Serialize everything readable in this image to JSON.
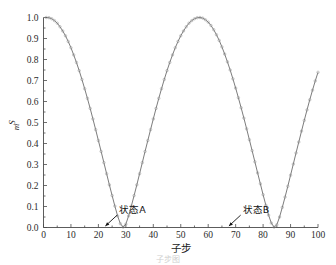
{
  "figure": {
    "caption_fragment": "子步图"
  },
  "chart_data": {
    "type": "line",
    "title": "",
    "subtitle": "",
    "xlabel": "子步",
    "ylabel": "S_m",
    "ylabel_base": "S",
    "ylabel_sub": "m",
    "xlim": [
      0,
      100
    ],
    "ylim": [
      0.0,
      1.0
    ],
    "grid": false,
    "legend": null,
    "legend_position": "none",
    "marker": "open-circle",
    "line_style": "solid",
    "line_color": "#5a5a5a",
    "marker_color": "#8a8a8a",
    "xticks": [
      0,
      10,
      20,
      30,
      40,
      50,
      60,
      70,
      80,
      90,
      100
    ],
    "xtick_labels": [
      "0",
      "10",
      "20",
      "30",
      "40",
      "50",
      "60",
      "70",
      "80",
      "90",
      "100"
    ],
    "yticks": [
      0.0,
      0.1,
      0.2,
      0.3,
      0.4,
      0.5,
      0.6,
      0.7,
      0.8,
      0.9,
      1.0
    ],
    "ytick_labels": [
      "0.0",
      "0.1",
      "0.2",
      "0.3",
      "0.4",
      "0.5",
      "0.6",
      "0.7",
      "0.8",
      "0.9",
      "1.0"
    ],
    "series": [
      {
        "name": "Sm",
        "x": [
          1,
          2,
          3,
          4,
          5,
          6,
          7,
          8,
          9,
          10,
          11,
          12,
          13,
          14,
          15,
          16,
          17,
          18,
          19,
          20,
          21,
          22,
          23,
          24,
          25,
          26,
          27,
          28,
          29,
          30,
          31,
          32,
          33,
          34,
          35,
          36,
          37,
          38,
          39,
          40,
          41,
          42,
          43,
          44,
          45,
          46,
          47,
          48,
          49,
          50,
          51,
          52,
          53,
          54,
          55,
          56,
          57,
          58,
          59,
          60,
          61,
          62,
          63,
          64,
          65,
          66,
          67,
          68,
          69,
          70,
          71,
          72,
          73,
          74,
          75,
          76,
          77,
          78,
          79,
          80,
          81,
          82,
          83,
          84,
          85,
          86,
          87,
          88,
          89,
          90,
          91,
          92,
          93,
          94,
          95,
          96,
          97,
          98,
          99,
          100
        ],
        "values": [
          1.0,
          0.999,
          0.994,
          0.985,
          0.973,
          0.956,
          0.936,
          0.913,
          0.886,
          0.856,
          0.822,
          0.786,
          0.747,
          0.705,
          0.661,
          0.615,
          0.567,
          0.517,
          0.466,
          0.414,
          0.362,
          0.309,
          0.256,
          0.203,
          0.152,
          0.102,
          0.055,
          0.018,
          0.002,
          0.016,
          0.055,
          0.102,
          0.152,
          0.203,
          0.256,
          0.309,
          0.362,
          0.414,
          0.466,
          0.517,
          0.567,
          0.615,
          0.661,
          0.705,
          0.747,
          0.786,
          0.822,
          0.856,
          0.886,
          0.913,
          0.936,
          0.956,
          0.973,
          0.985,
          0.994,
          0.999,
          1.0,
          0.997,
          0.989,
          0.978,
          0.962,
          0.942,
          0.918,
          0.891,
          0.86,
          0.826,
          0.789,
          0.75,
          0.708,
          0.664,
          0.618,
          0.57,
          0.521,
          0.47,
          0.418,
          0.366,
          0.313,
          0.26,
          0.208,
          0.156,
          0.106,
          0.059,
          0.021,
          0.002,
          0.013,
          0.05,
          0.096,
          0.145,
          0.196,
          0.249,
          0.302,
          0.355,
          0.407,
          0.459,
          0.51,
          0.56,
          0.608,
          0.654,
          0.698,
          0.739
        ],
        "description": "rectified sinusoid"
      }
    ],
    "annotations": [
      {
        "id": "state-a",
        "label": "状态A",
        "target_x": 22,
        "target_y": 0.0,
        "text_x": 25,
        "text_y": 0.085
      },
      {
        "id": "state-b",
        "label": "状态B",
        "target_x": 67,
        "target_y": 0.0,
        "text_x": 70,
        "text_y": 0.085
      }
    ],
    "key_points": {
      "maxima_x": [
        1,
        44.5,
        89
      ],
      "maxima_y": [
        1.0,
        0.995,
        0.995
      ],
      "minima_x": [
        22,
        67
      ],
      "minima_y": [
        0.01,
        0.01
      ],
      "end_value": 0.61,
      "period": 44.5
    }
  }
}
